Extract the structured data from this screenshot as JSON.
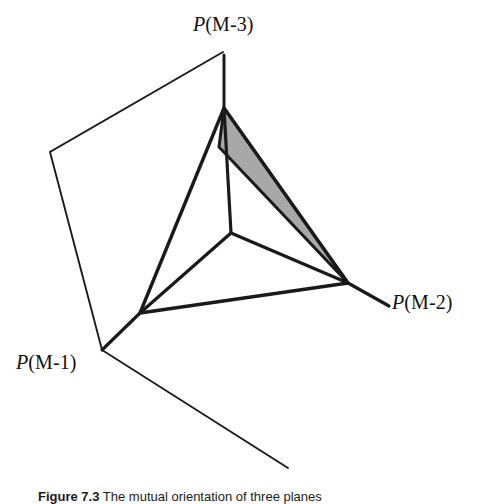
{
  "figure": {
    "background_color": "#ffffff",
    "line_color": "#1a1a1a",
    "shade_color": "#a8a8a8",
    "labels": {
      "m3": {
        "symbol": "P",
        "arg": "(M-3)"
      },
      "m2": {
        "symbol": "P",
        "arg": "(M-2)"
      },
      "m1": {
        "symbol": "P",
        "arg": "(M-1)"
      }
    },
    "caption": {
      "label": "Figure 7.3",
      "text": "The mutual orientation of three planes"
    },
    "geometry": {
      "vertices": {
        "apex": [
          224,
          108
        ],
        "left": [
          140,
          313
        ],
        "right": [
          348,
          283
        ],
        "center": [
          231,
          233
        ],
        "shade_inner": [
          219,
          147
        ]
      },
      "outer_polygon": [
        [
          223,
          52
        ],
        [
          50,
          152
        ],
        [
          102,
          350
        ],
        [
          288,
          468
        ]
      ],
      "stems": {
        "m3": [
          [
            224,
            55
          ],
          [
            224,
            108
          ]
        ],
        "m2": [
          [
            348,
            283
          ],
          [
            389,
            306
          ]
        ],
        "m1": [
          [
            140,
            313
          ],
          [
            102,
            350
          ]
        ]
      },
      "inner_edges": [
        [
          [
            231,
            233
          ],
          [
            224,
            108
          ]
        ],
        [
          [
            231,
            233
          ],
          [
            140,
            313
          ]
        ],
        [
          [
            231,
            233
          ],
          [
            348,
            283
          ]
        ]
      ],
      "outline_triangle": [
        [
          224,
          108
        ],
        [
          140,
          313
        ],
        [
          348,
          283
        ]
      ],
      "shaded_triangle": [
        [
          224,
          108
        ],
        [
          219,
          147
        ],
        [
          348,
          283
        ]
      ]
    }
  }
}
